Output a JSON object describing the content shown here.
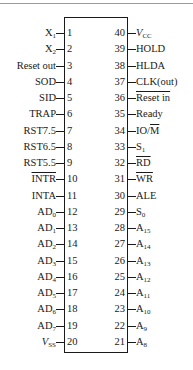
{
  "diagram": {
    "left_pins": [
      {
        "num": "1",
        "base": "X",
        "sub": "1",
        "overline": false,
        "italic": false
      },
      {
        "num": "2",
        "base": "X",
        "sub": "2",
        "overline": false,
        "italic": false
      },
      {
        "num": "3",
        "base": "Reset out",
        "sub": "",
        "overline": false,
        "italic": false
      },
      {
        "num": "4",
        "base": "SOD",
        "sub": "",
        "overline": false,
        "italic": false
      },
      {
        "num": "5",
        "base": "SID",
        "sub": "",
        "overline": false,
        "italic": false
      },
      {
        "num": "6",
        "base": "TRAP",
        "sub": "",
        "overline": false,
        "italic": false
      },
      {
        "num": "7",
        "base": "RST7.5",
        "sub": "",
        "overline": false,
        "italic": false
      },
      {
        "num": "8",
        "base": "RST6.5",
        "sub": "",
        "overline": false,
        "italic": false
      },
      {
        "num": "9",
        "base": "RST5.5",
        "sub": "",
        "overline": false,
        "italic": false
      },
      {
        "num": "10",
        "base": "INTR",
        "sub": "",
        "overline": true,
        "italic": false
      },
      {
        "num": "11",
        "base": "INTA",
        "sub": "",
        "overline": false,
        "italic": false
      },
      {
        "num": "12",
        "base": "AD",
        "sub": "0",
        "overline": false,
        "italic": false
      },
      {
        "num": "13",
        "base": "AD",
        "sub": "1",
        "overline": false,
        "italic": false
      },
      {
        "num": "14",
        "base": "AD",
        "sub": "2",
        "overline": false,
        "italic": false
      },
      {
        "num": "15",
        "base": "AD",
        "sub": "3",
        "overline": false,
        "italic": false
      },
      {
        "num": "16",
        "base": "AD",
        "sub": "4",
        "overline": false,
        "italic": false
      },
      {
        "num": "17",
        "base": "AD",
        "sub": "5",
        "overline": false,
        "italic": false
      },
      {
        "num": "18",
        "base": "AD",
        "sub": "6",
        "overline": false,
        "italic": false
      },
      {
        "num": "19",
        "base": "AD",
        "sub": "7",
        "overline": false,
        "italic": false
      },
      {
        "num": "20",
        "base": "V",
        "sub": "SS",
        "overline": false,
        "italic": true
      }
    ],
    "right_pins": [
      {
        "num": "40",
        "base": "V",
        "sub": "CC",
        "overline": false,
        "italic": true
      },
      {
        "num": "39",
        "base": "HOLD",
        "sub": "",
        "overline": false,
        "italic": false
      },
      {
        "num": "38",
        "base": "HLDA",
        "sub": "",
        "overline": false,
        "italic": false
      },
      {
        "num": "37",
        "base": "CLK(out)",
        "sub": "",
        "overline": false,
        "italic": false
      },
      {
        "num": "36",
        "base": "Reset in",
        "sub": "",
        "overline": true,
        "italic": false
      },
      {
        "num": "35",
        "base": "Ready",
        "sub": "",
        "overline": false,
        "italic": false
      },
      {
        "num": "34",
        "base": "IO/",
        "suffix_overline": "M",
        "sub": "",
        "overline": false,
        "italic": false
      },
      {
        "num": "33",
        "base": "S",
        "sub": "1",
        "overline": false,
        "italic": false
      },
      {
        "num": "32",
        "base": "RD",
        "sub": "",
        "overline": true,
        "italic": false
      },
      {
        "num": "31",
        "base": "WR",
        "sub": "",
        "overline": true,
        "italic": false
      },
      {
        "num": "30",
        "base": "ALE",
        "sub": "",
        "overline": false,
        "italic": false
      },
      {
        "num": "29",
        "base": "S",
        "sub": "0",
        "overline": false,
        "italic": false
      },
      {
        "num": "28",
        "base": "A",
        "sub": "15",
        "overline": false,
        "italic": false
      },
      {
        "num": "27",
        "base": "A",
        "sub": "14",
        "overline": false,
        "italic": false
      },
      {
        "num": "26",
        "base": "A",
        "sub": "13",
        "overline": false,
        "italic": false
      },
      {
        "num": "25",
        "base": "A",
        "sub": "12",
        "overline": false,
        "italic": false
      },
      {
        "num": "24",
        "base": "A",
        "sub": "11",
        "overline": false,
        "italic": false
      },
      {
        "num": "23",
        "base": "A",
        "sub": "10",
        "overline": false,
        "italic": false
      },
      {
        "num": "22",
        "base": "A",
        "sub": "9",
        "overline": false,
        "italic": false
      },
      {
        "num": "21",
        "base": "A",
        "sub": "8",
        "overline": false,
        "italic": false
      }
    ]
  },
  "layout": {
    "first_pin_y": 26,
    "pin_pitch": 16.25,
    "line_color": "#1a1a1a"
  }
}
